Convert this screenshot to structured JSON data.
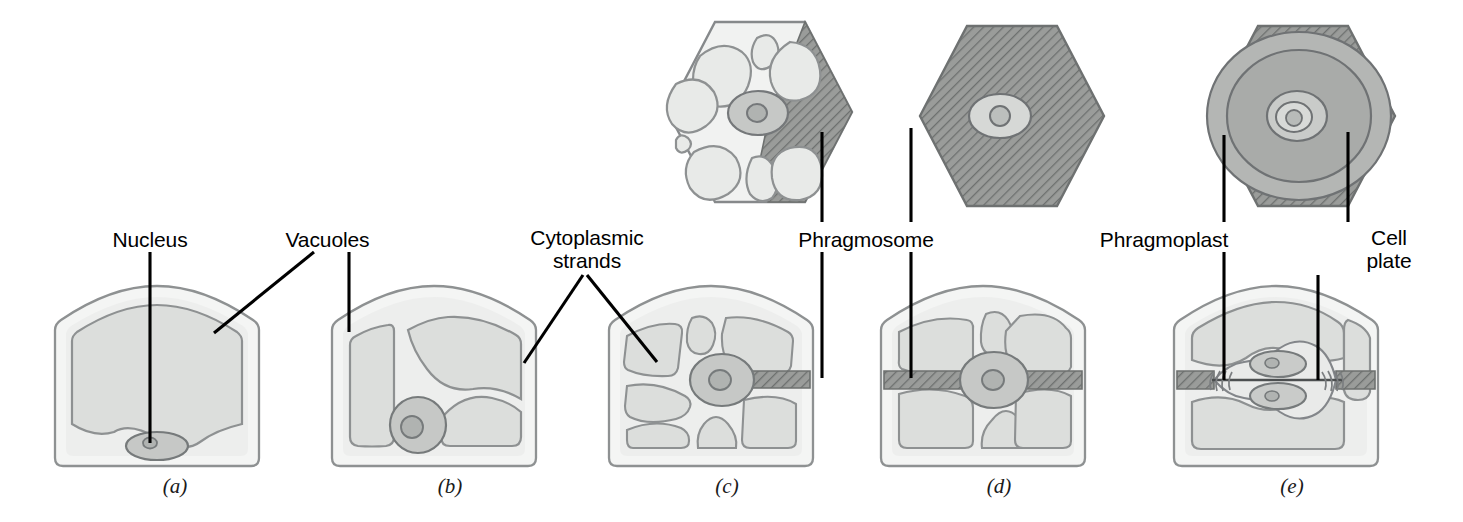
{
  "figure": {
    "background_color": "#ffffff",
    "label_color": "#000000",
    "leader_color": "#000000"
  },
  "palette": {
    "cell_wall_outline": "#8a8d8f",
    "cytoplasm_fill": "#f1f2f1",
    "vacuole_fill": "#dcdedc",
    "vacuole_outline": "#8e9192",
    "nucleus_fill": "#c6c8c6",
    "nucleus_outline": "#7b7e80",
    "nucleolus_fill": "#b2b5b3",
    "hatch_fill": "#9a9c9a",
    "hatch_line": "#6f7271",
    "phragmoplast_ring": "#b9bbb9",
    "cell_plate_fill": "#d2d4d2"
  },
  "labels": [
    {
      "id": "nucleus",
      "text": "Nucleus",
      "x": 150,
      "y": 228,
      "align": "center"
    },
    {
      "id": "vacuoles",
      "text": "Vacuoles",
      "x": 327,
      "y": 228,
      "align": "center"
    },
    {
      "id": "cytoplasmic-strands",
      "text": "Cytoplasmic\nstrands",
      "x": 587,
      "y": 228,
      "align": "center"
    },
    {
      "id": "phragmosome",
      "text": "Phragmosome",
      "x": 866,
      "y": 228,
      "align": "center"
    },
    {
      "id": "phragmoplast",
      "text": "Phragmoplast",
      "x": 1164,
      "y": 228,
      "align": "center"
    },
    {
      "id": "cell-plate",
      "text": "Cell\nplate",
      "x": 1389,
      "y": 228,
      "align": "center"
    }
  ],
  "panels": [
    {
      "id": "a",
      "letter": "(a)",
      "letter_x": 175,
      "letter_y": 474,
      "caption_stage": "single large vacuole, nucleus at base",
      "has_top_view": false,
      "vacuole_count": 1,
      "nucleus_position": "bottom-center",
      "phragmosome": "none"
    },
    {
      "id": "b",
      "letter": "(b)",
      "letter_x": 450,
      "letter_y": 474,
      "caption_stage": "vacuole fragmenting, cytoplasmic strands forming",
      "has_top_view": false,
      "vacuole_count": 3,
      "nucleus_position": "bottom-center",
      "phragmosome": "none"
    },
    {
      "id": "c",
      "letter": "(c)",
      "letter_x": 727,
      "letter_y": 474,
      "caption_stage": "nucleus central, many vacuoles, partial phragmosome",
      "has_top_view": true,
      "vacuole_count": 8,
      "nucleus_position": "center",
      "phragmosome": "partial"
    },
    {
      "id": "d",
      "letter": "(d)",
      "letter_x": 999,
      "letter_y": 474,
      "caption_stage": "phragmosome spans full cell width",
      "has_top_view": true,
      "vacuole_count": 6,
      "nucleus_position": "center",
      "phragmosome": "complete"
    },
    {
      "id": "e",
      "letter": "(e)",
      "letter_x": 1292,
      "letter_y": 474,
      "caption_stage": "phragmoplast and cell plate between daughter nuclei",
      "has_top_view": true,
      "vacuole_count": 3,
      "nucleus_position": "two-daughter-nuclei",
      "phragmosome": "complete-with-cell-plate"
    }
  ],
  "structures": {
    "nucleus": "Nucleus",
    "vacuoles": "Vacuoles",
    "cytoplasmic_strands": "Cytoplasmic strands",
    "phragmosome": "Phragmosome",
    "phragmoplast": "Phragmoplast",
    "cell_plate": "Cell plate"
  }
}
